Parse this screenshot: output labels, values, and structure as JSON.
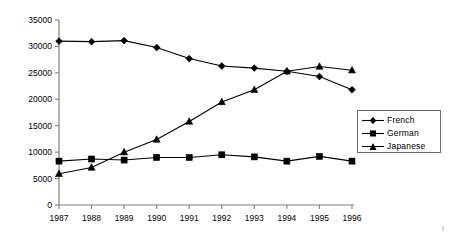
{
  "chart_data": {
    "type": "line",
    "title": "",
    "subtitle": "",
    "xlabel": "",
    "ylabel": "",
    "categories": [
      "1987",
      "1988",
      "1989",
      "1990",
      "1991",
      "1992",
      "1993",
      "1994",
      "1995",
      "1996"
    ],
    "x_tick_labels": [
      "1987",
      "1988",
      "1989",
      "1990",
      "1991",
      "1992",
      "1993",
      "1994",
      "1995",
      "1996"
    ],
    "y_tick_labels": [
      "0",
      "5000",
      "10000",
      "15000",
      "20000",
      "25000",
      "30000",
      "35000"
    ],
    "y_ticks": [
      0,
      5000,
      10000,
      15000,
      20000,
      25000,
      30000,
      35000
    ],
    "ylim": [
      0,
      35000
    ],
    "grid": false,
    "legend_position": "right",
    "series": [
      {
        "name": "French",
        "marker": "diamond",
        "color": "#000000",
        "values": [
          31000,
          30900,
          31100,
          29800,
          27700,
          26300,
          25900,
          25300,
          24300,
          21800
        ]
      },
      {
        "name": "German",
        "marker": "square",
        "color": "#000000",
        "values": [
          8300,
          8700,
          8500,
          9000,
          9000,
          9500,
          9100,
          8300,
          9200,
          8300
        ]
      },
      {
        "name": "Japanese",
        "marker": "triangle",
        "color": "#000000",
        "values": [
          5900,
          7100,
          10000,
          12400,
          15800,
          19500,
          21800,
          25300,
          26200,
          25500
        ]
      }
    ]
  },
  "legend": {
    "items": [
      {
        "label": "French",
        "marker": "diamond"
      },
      {
        "label": "German",
        "marker": "square"
      },
      {
        "label": "Japanese",
        "marker": "triangle"
      }
    ]
  }
}
